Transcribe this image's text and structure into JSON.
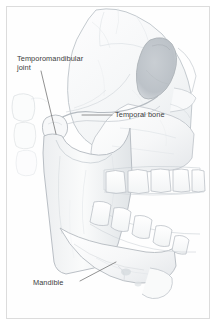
{
  "figure": {
    "style": "pencil medical illustration",
    "border_color": "#dcdcdc",
    "background_color": "#ffffff",
    "ink_color": "#9aa0a6",
    "text_color": "#3c3c3c",
    "shade_color": "#cdd2d6",
    "width": 217,
    "height": 326
  },
  "labels": [
    {
      "id": "temporomandibular-joint",
      "line1": "Temporomandibular",
      "line2": "joint",
      "text": "Temporomandibular joint",
      "points_to": "mandibular condyle"
    },
    {
      "id": "temporal-bone",
      "text": "Temporal bone",
      "points_to": "zygomatic arch / temporal bone"
    },
    {
      "id": "mandible",
      "text": "Mandible",
      "points_to": "body of mandible"
    }
  ],
  "anatomy": {
    "structures": [
      "cranium",
      "frontal bone",
      "orbit",
      "nasal bone",
      "maxilla",
      "zygomatic arch",
      "temporal bone",
      "mandibular condyle",
      "coronoid process",
      "ramus of mandible",
      "body of mandible",
      "mental protuberance",
      "upper dental arch",
      "lower dental arch",
      "cervical vertebrae"
    ],
    "teeth": {
      "upper_count": 8,
      "lower_count": 8
    }
  }
}
